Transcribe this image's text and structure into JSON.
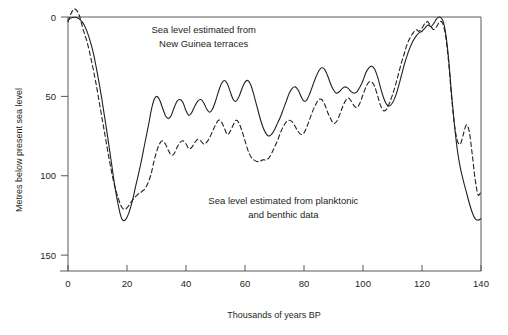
{
  "chart_data": {
    "type": "line",
    "title": "",
    "xlabel": "Thousands of years BP",
    "ylabel": "Metres below present sea level",
    "xlim": [
      0,
      140
    ],
    "ylim": [
      0,
      160
    ],
    "y_inverted": true,
    "grid": false,
    "legend_position": "in-plot annotations",
    "xticks": [
      0,
      20,
      40,
      60,
      80,
      100,
      120,
      140
    ],
    "xtick_labels": [
      "0",
      "20",
      "40",
      "60",
      "80",
      "100",
      "120",
      "140"
    ],
    "yticks": [
      0,
      50,
      100,
      150
    ],
    "ytick_labels": [
      "0",
      "50",
      "100",
      "150"
    ],
    "annotations": [
      {
        "name": "new-guinea-annotation",
        "lines": [
          "Sea level estimated from",
          "New Guinea terraces"
        ],
        "x": 46,
        "y": 10
      },
      {
        "name": "planktonic-benthic-annotation",
        "lines": [
          "Sea level estimated from planktonic",
          "and benthic data"
        ],
        "x": 73,
        "y": 118
      }
    ],
    "series": [
      {
        "name": "Sea level estimated from New Guinea terraces",
        "style": "solid",
        "color": "#231f20",
        "points": [
          [
            0,
            2
          ],
          [
            1.2,
            0.5
          ],
          [
            2.5,
            0.2
          ],
          [
            4,
            1.5
          ],
          [
            5.5,
            5
          ],
          [
            7,
            12
          ],
          [
            8.5,
            22
          ],
          [
            10,
            36
          ],
          [
            11.5,
            52
          ],
          [
            13,
            70
          ],
          [
            14.5,
            89
          ],
          [
            16,
            108
          ],
          [
            17.2,
            120
          ],
          [
            18.2,
            127
          ],
          [
            19.3,
            128
          ],
          [
            20.5,
            124
          ],
          [
            21.8,
            116
          ],
          [
            23,
            106
          ],
          [
            24.5,
            94
          ],
          [
            26,
            80
          ],
          [
            27.3,
            68
          ],
          [
            28.3,
            58
          ],
          [
            29.2,
            52
          ],
          [
            30,
            50
          ],
          [
            31,
            52
          ],
          [
            32,
            57
          ],
          [
            33,
            62
          ],
          [
            34,
            64
          ],
          [
            35,
            62
          ],
          [
            36,
            57
          ],
          [
            37,
            53
          ],
          [
            38,
            52
          ],
          [
            39,
            54
          ],
          [
            40,
            59
          ],
          [
            41,
            62
          ],
          [
            42,
            60
          ],
          [
            43,
            56
          ],
          [
            44,
            53
          ],
          [
            45,
            52
          ],
          [
            46,
            54
          ],
          [
            47,
            58
          ],
          [
            48,
            60
          ],
          [
            49,
            58
          ],
          [
            50,
            53
          ],
          [
            51,
            47
          ],
          [
            52,
            42
          ],
          [
            53,
            40
          ],
          [
            54,
            42
          ],
          [
            55,
            47
          ],
          [
            56,
            52
          ],
          [
            57,
            53
          ],
          [
            58,
            50
          ],
          [
            59,
            45
          ],
          [
            60,
            41
          ],
          [
            61,
            40
          ],
          [
            62,
            43
          ],
          [
            63,
            49
          ],
          [
            64,
            56
          ],
          [
            65,
            63
          ],
          [
            66,
            69
          ],
          [
            67,
            73
          ],
          [
            68,
            75
          ],
          [
            69,
            74
          ],
          [
            70,
            71
          ],
          [
            71,
            67
          ],
          [
            72,
            63
          ],
          [
            73,
            58
          ],
          [
            74,
            53
          ],
          [
            75,
            48
          ],
          [
            76,
            45
          ],
          [
            77,
            44
          ],
          [
            78,
            46
          ],
          [
            79,
            50
          ],
          [
            80,
            53
          ],
          [
            81,
            52
          ],
          [
            82,
            48
          ],
          [
            83,
            43
          ],
          [
            84,
            38
          ],
          [
            85,
            34
          ],
          [
            86,
            32
          ],
          [
            87,
            33
          ],
          [
            88,
            37
          ],
          [
            89,
            42
          ],
          [
            90,
            46
          ],
          [
            91,
            48
          ],
          [
            92,
            47
          ],
          [
            93,
            45
          ],
          [
            94,
            44
          ],
          [
            95,
            45
          ],
          [
            96,
            47
          ],
          [
            97,
            48
          ],
          [
            98,
            47
          ],
          [
            99,
            44
          ],
          [
            100,
            40
          ],
          [
            101,
            35
          ],
          [
            102,
            32
          ],
          [
            103,
            31
          ],
          [
            104,
            33
          ],
          [
            105,
            38
          ],
          [
            106,
            45
          ],
          [
            107,
            51
          ],
          [
            108,
            55
          ],
          [
            109,
            56
          ],
          [
            110,
            54
          ],
          [
            111,
            50
          ],
          [
            112,
            44
          ],
          [
            113,
            37
          ],
          [
            114,
            30
          ],
          [
            115,
            24
          ],
          [
            116,
            19
          ],
          [
            117,
            15
          ],
          [
            118,
            12
          ],
          [
            119,
            10
          ],
          [
            120,
            9
          ],
          [
            121,
            7
          ],
          [
            122,
            5
          ],
          [
            123,
            6
          ],
          [
            124,
            4
          ],
          [
            125,
            1
          ],
          [
            126,
            0
          ],
          [
            127,
            2
          ],
          [
            128,
            10
          ],
          [
            129,
            26
          ],
          [
            130,
            48
          ],
          [
            131,
            68
          ],
          [
            132,
            84
          ],
          [
            133,
            95
          ],
          [
            134,
            103
          ],
          [
            135,
            110
          ],
          [
            136,
            117
          ],
          [
            137,
            123
          ],
          [
            138,
            127
          ],
          [
            139,
            128
          ],
          [
            140,
            127
          ]
        ]
      },
      {
        "name": "Sea level estimated from planktonic and benthic data",
        "style": "dashed",
        "color": "#231f20",
        "points": [
          [
            0,
            3
          ],
          [
            1,
            -2
          ],
          [
            2,
            -5
          ],
          [
            3,
            -4
          ],
          [
            4,
            0
          ],
          [
            5,
            7
          ],
          [
            6.5,
            16
          ],
          [
            8,
            28
          ],
          [
            9.5,
            42
          ],
          [
            11,
            58
          ],
          [
            12.5,
            74
          ],
          [
            14,
            90
          ],
          [
            15.5,
            104
          ],
          [
            17,
            114
          ],
          [
            18.3,
            120
          ],
          [
            19.5,
            121
          ],
          [
            20.5,
            119
          ],
          [
            22,
            115
          ],
          [
            23.5,
            112
          ],
          [
            25,
            110
          ],
          [
            26.5,
            107
          ],
          [
            28,
            100
          ],
          [
            29,
            92
          ],
          [
            30,
            85
          ],
          [
            31,
            80
          ],
          [
            32,
            78
          ],
          [
            33,
            80
          ],
          [
            34,
            84
          ],
          [
            35,
            87
          ],
          [
            36,
            86
          ],
          [
            37,
            82
          ],
          [
            38,
            79
          ],
          [
            39,
            78
          ],
          [
            40,
            80
          ],
          [
            41,
            83
          ],
          [
            42,
            82
          ],
          [
            43,
            79
          ],
          [
            44,
            77
          ],
          [
            45,
            78
          ],
          [
            46,
            80
          ],
          [
            47,
            79
          ],
          [
            48,
            76
          ],
          [
            49,
            72
          ],
          [
            50,
            68
          ],
          [
            51,
            65
          ],
          [
            52,
            66
          ],
          [
            53,
            70
          ],
          [
            54,
            74
          ],
          [
            55,
            72
          ],
          [
            56,
            68
          ],
          [
            57,
            65
          ],
          [
            58,
            67
          ],
          [
            59,
            72
          ],
          [
            60,
            78
          ],
          [
            61,
            84
          ],
          [
            62,
            88
          ],
          [
            63,
            90
          ],
          [
            64,
            91
          ],
          [
            65,
            91
          ],
          [
            66,
            90
          ],
          [
            67,
            90
          ],
          [
            68,
            89
          ],
          [
            69,
            86
          ],
          [
            70,
            82
          ],
          [
            71,
            78
          ],
          [
            72,
            73
          ],
          [
            73,
            69
          ],
          [
            74,
            66
          ],
          [
            75,
            65
          ],
          [
            76,
            66
          ],
          [
            77,
            69
          ],
          [
            78,
            72
          ],
          [
            79,
            74
          ],
          [
            80,
            73
          ],
          [
            81,
            69
          ],
          [
            82,
            64
          ],
          [
            83,
            59
          ],
          [
            84,
            55
          ],
          [
            85,
            52
          ],
          [
            86,
            52
          ],
          [
            87,
            55
          ],
          [
            88,
            60
          ],
          [
            89,
            64
          ],
          [
            90,
            67
          ],
          [
            91,
            66
          ],
          [
            92,
            62
          ],
          [
            93,
            57
          ],
          [
            94,
            53
          ],
          [
            95,
            51
          ],
          [
            96,
            53
          ],
          [
            97,
            56
          ],
          [
            98,
            57
          ],
          [
            99,
            54
          ],
          [
            100,
            49
          ],
          [
            101,
            44
          ],
          [
            102,
            41
          ],
          [
            103,
            41
          ],
          [
            104,
            44
          ],
          [
            105,
            50
          ],
          [
            106,
            56
          ],
          [
            107,
            59
          ],
          [
            108,
            58
          ],
          [
            109,
            54
          ],
          [
            110,
            49
          ],
          [
            111,
            43
          ],
          [
            112,
            36
          ],
          [
            113,
            29
          ],
          [
            114,
            23
          ],
          [
            115,
            17
          ],
          [
            116,
            13
          ],
          [
            117,
            10
          ],
          [
            118,
            8
          ],
          [
            119,
            9
          ],
          [
            120,
            7
          ],
          [
            121,
            4
          ],
          [
            122,
            3
          ],
          [
            123,
            6
          ],
          [
            124,
            8
          ],
          [
            125,
            6
          ],
          [
            126,
            3
          ],
          [
            127,
            4
          ],
          [
            128,
            12
          ],
          [
            129,
            28
          ],
          [
            130,
            50
          ],
          [
            131,
            68
          ],
          [
            132,
            78
          ],
          [
            133,
            80
          ],
          [
            134,
            74
          ],
          [
            135,
            68
          ],
          [
            136,
            72
          ],
          [
            137,
            86
          ],
          [
            138,
            102
          ],
          [
            139,
            112
          ],
          [
            140,
            110
          ]
        ]
      }
    ]
  }
}
